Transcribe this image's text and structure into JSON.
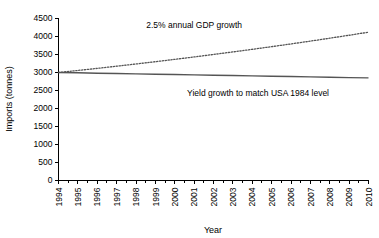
{
  "chart_data": {
    "type": "line",
    "title": "",
    "xlabel": "Year",
    "ylabel": "Imports (tonnes)",
    "xlim": [
      1994,
      2010
    ],
    "ylim": [
      0,
      4500
    ],
    "grid": false,
    "legend": "none",
    "x": [
      1994,
      1995,
      1996,
      1997,
      1998,
      1999,
      2000,
      2001,
      2002,
      2003,
      2004,
      2005,
      2006,
      2007,
      2008,
      2009,
      2010
    ],
    "xtick_labels": [
      "1994",
      "1995",
      "1996",
      "1997",
      "1998",
      "1999",
      "2000",
      "2001",
      "2002",
      "2003",
      "2004",
      "2005",
      "2006",
      "2007",
      "2008",
      "2009",
      "2010"
    ],
    "ytick_labels": [
      "0",
      "500",
      "1000",
      "1500",
      "2000",
      "2500",
      "3000",
      "3500",
      "4000",
      "4500"
    ],
    "ytick_values": [
      0,
      500,
      1000,
      1500,
      2000,
      2500,
      3000,
      3500,
      4000,
      4500
    ],
    "series": [
      {
        "name": "2.5% annual GDP growth",
        "style": "dotted",
        "color": "#555555",
        "values": [
          3000,
          3057,
          3115,
          3175,
          3237,
          3300,
          3365,
          3432,
          3501,
          3571,
          3644,
          3718,
          3794,
          3872,
          3953,
          4035,
          4120
        ]
      },
      {
        "name": "Yield growth to match USA 1984 level",
        "style": "solid",
        "color": "#555555",
        "values": [
          3000,
          2991,
          2981,
          2972,
          2963,
          2953,
          2944,
          2934,
          2925,
          2916,
          2906,
          2897,
          2888,
          2878,
          2869,
          2859,
          2850
        ]
      }
    ],
    "annotations": [
      {
        "text": "2.5% annual GDP growth",
        "x": 2001.0,
        "y": 4230
      },
      {
        "text": "Yield growth to match USA 1984 level",
        "x": 2004.3,
        "y": 2340
      }
    ]
  }
}
